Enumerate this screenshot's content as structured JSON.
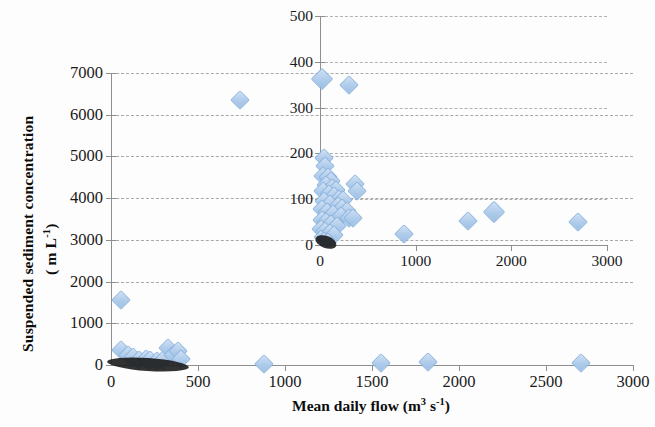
{
  "figure": {
    "background": "#fdfdfd",
    "marker_color": "#aecbea",
    "marker_edge": "#8fb6de",
    "gridline_color": "#9a9a9a",
    "axis_color": "#8f8f8f"
  },
  "axis_titles": {
    "y_line1": "Suspended sediment concentration",
    "y_line2_prefix": "( m L",
    "y_line2_sup": "-1",
    "y_line2_suffix": ")",
    "x_prefix": "Mean daily flow (m",
    "x_sup1": "3",
    "x_mid": " s",
    "x_sup2": "-1",
    "x_suffix": ")"
  },
  "chart_data": [
    {
      "type": "scatter",
      "name": "main",
      "title": "",
      "xlabel": "Mean daily flow (m3 s-1)",
      "ylabel": "Suspended sediment concentration (m L-1)",
      "xlim": [
        0,
        3000
      ],
      "ylim": [
        0,
        7000
      ],
      "xticks": [
        0,
        500,
        1000,
        1500,
        2000,
        2500,
        3000
      ],
      "yticks": [
        0,
        1000,
        2000,
        3000,
        4000,
        5000,
        6000,
        7000
      ],
      "grid": "horizontal-dashed",
      "legend": "none",
      "points": [
        {
          "x": 740,
          "y": 6350,
          "size": "md"
        },
        {
          "x": 60,
          "y": 1570,
          "size": "md"
        },
        {
          "x": 55,
          "y": 370,
          "size": "md"
        },
        {
          "x": 100,
          "y": 250,
          "size": "md"
        },
        {
          "x": 125,
          "y": 180,
          "size": "md"
        },
        {
          "x": 160,
          "y": 120,
          "size": "md"
        },
        {
          "x": 200,
          "y": 155,
          "size": "md"
        },
        {
          "x": 225,
          "y": 110,
          "size": "md"
        },
        {
          "x": 265,
          "y": 95,
          "size": "md"
        },
        {
          "x": 300,
          "y": 110,
          "size": "md"
        },
        {
          "x": 330,
          "y": 400,
          "size": "md"
        },
        {
          "x": 355,
          "y": 240,
          "size": "md"
        },
        {
          "x": 385,
          "y": 330,
          "size": "md"
        },
        {
          "x": 400,
          "y": 140,
          "size": "md"
        },
        {
          "x": 880,
          "y": 30,
          "size": "md"
        },
        {
          "x": 1550,
          "y": 55,
          "size": "md"
        },
        {
          "x": 1820,
          "y": 70,
          "size": "md"
        },
        {
          "x": 2700,
          "y": 50,
          "size": "md"
        }
      ]
    },
    {
      "type": "scatter",
      "name": "inset",
      "title": "",
      "xlabel": "",
      "ylabel": "",
      "xlim": [
        0,
        3000
      ],
      "ylim": [
        0,
        500
      ],
      "xticks": [
        0,
        1000,
        2000,
        3000
      ],
      "yticks": [
        0,
        100,
        200,
        300,
        400,
        500
      ],
      "grid": "horizontal-dashed",
      "legend": "none",
      "points": [
        {
          "x": 25,
          "y": 363,
          "size": "lg"
        },
        {
          "x": 300,
          "y": 350,
          "size": "md"
        },
        {
          "x": 45,
          "y": 190,
          "size": "md"
        },
        {
          "x": 55,
          "y": 172,
          "size": "md"
        },
        {
          "x": 30,
          "y": 150,
          "size": "md"
        },
        {
          "x": 80,
          "y": 148,
          "size": "md"
        },
        {
          "x": 110,
          "y": 140,
          "size": "md"
        },
        {
          "x": 60,
          "y": 132,
          "size": "md"
        },
        {
          "x": 130,
          "y": 125,
          "size": "md"
        },
        {
          "x": 165,
          "y": 120,
          "size": "md"
        },
        {
          "x": 370,
          "y": 133,
          "size": "md"
        },
        {
          "x": 390,
          "y": 118,
          "size": "md"
        },
        {
          "x": 35,
          "y": 118,
          "size": "md"
        },
        {
          "x": 95,
          "y": 112,
          "size": "md"
        },
        {
          "x": 150,
          "y": 106,
          "size": "md"
        },
        {
          "x": 200,
          "y": 100,
          "size": "md"
        },
        {
          "x": 245,
          "y": 98,
          "size": "md"
        },
        {
          "x": 40,
          "y": 95,
          "size": "md"
        },
        {
          "x": 105,
          "y": 90,
          "size": "md"
        },
        {
          "x": 185,
          "y": 85,
          "size": "md"
        },
        {
          "x": 230,
          "y": 80,
          "size": "md"
        },
        {
          "x": 280,
          "y": 75,
          "size": "md"
        },
        {
          "x": 25,
          "y": 78,
          "size": "md"
        },
        {
          "x": 70,
          "y": 72,
          "size": "md"
        },
        {
          "x": 140,
          "y": 68,
          "size": "md"
        },
        {
          "x": 215,
          "y": 64,
          "size": "md"
        },
        {
          "x": 300,
          "y": 60,
          "size": "md"
        },
        {
          "x": 340,
          "y": 58,
          "size": "md"
        },
        {
          "x": 20,
          "y": 55,
          "size": "md"
        },
        {
          "x": 60,
          "y": 50,
          "size": "md"
        },
        {
          "x": 120,
          "y": 46,
          "size": "md"
        },
        {
          "x": 175,
          "y": 42,
          "size": "md"
        },
        {
          "x": 15,
          "y": 35,
          "size": "md"
        },
        {
          "x": 55,
          "y": 30,
          "size": "md"
        },
        {
          "x": 100,
          "y": 26,
          "size": "md"
        },
        {
          "x": 145,
          "y": 22,
          "size": "md"
        },
        {
          "x": 10,
          "y": 18,
          "size": "sm"
        },
        {
          "x": 45,
          "y": 14,
          "size": "sm"
        },
        {
          "x": 85,
          "y": 10,
          "size": "sm"
        },
        {
          "x": 880,
          "y": 25,
          "size": "md"
        },
        {
          "x": 1550,
          "y": 53,
          "size": "md"
        },
        {
          "x": 1820,
          "y": 72,
          "size": "lg"
        },
        {
          "x": 2700,
          "y": 50,
          "size": "md"
        }
      ]
    }
  ]
}
